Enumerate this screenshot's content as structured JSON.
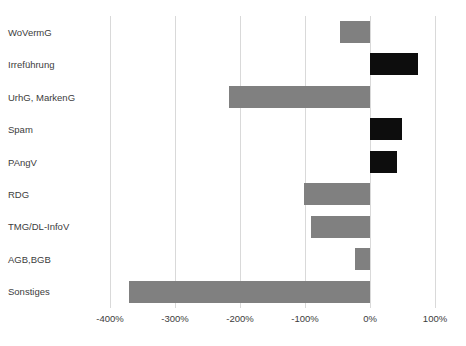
{
  "chart_data": {
    "type": "bar",
    "orientation": "horizontal",
    "title": "",
    "subtitle": "",
    "xlabel": "",
    "ylabel": "",
    "categories": [
      "WoVermG",
      "Irreführung",
      "UrhG, MarkenG",
      "Spam",
      "PAngV",
      "RDG",
      "TMG/DL-InfoV",
      "AGB,BGB",
      "Sonstiges"
    ],
    "values": [
      -46,
      74,
      -217,
      49,
      42,
      -101,
      -91,
      -23,
      -371
    ],
    "value_unit": "%",
    "xlim": [
      -400,
      100
    ],
    "xticks": [
      -400,
      -300,
      -200,
      -100,
      0,
      100
    ],
    "xtick_labels": [
      "-400%",
      "-300%",
      "-200%",
      "-100%",
      "0%",
      "100%"
    ],
    "grid": true,
    "grid_axis": "x",
    "legend": "none",
    "colors": {
      "negative_bar": "#808080",
      "positive_bar": "#0d0d0d",
      "gridline": "#d9d9d9",
      "text": "#3c3c3c",
      "background": "#ffffff"
    },
    "bar_colors": [
      "#808080",
      "#0d0d0d",
      "#808080",
      "#0d0d0d",
      "#0d0d0d",
      "#808080",
      "#808080",
      "#808080",
      "#808080"
    ]
  }
}
